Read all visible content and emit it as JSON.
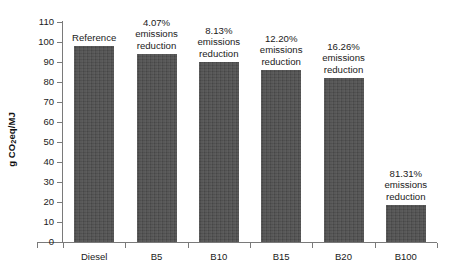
{
  "chart_data": {
    "type": "bar",
    "title": "",
    "subtitle": "",
    "xlabel": "",
    "ylabel": "g CO2eq/MJ",
    "ylabel_parts": {
      "prefix": "g CO",
      "sub": "2",
      "suffix": "eq/MJ"
    },
    "categories": [
      "Diesel",
      "B5",
      "B10",
      "B15",
      "B20",
      "B100"
    ],
    "values": [
      98.0,
      94.0,
      90.0,
      86.0,
      82.0,
      18.4
    ],
    "annotations": [
      "Reference",
      "4.07%\nemissions\nreduction",
      "8.13%\nemissions\nreduction",
      "12.20%\nemissions\nreduction",
      "16.26%\nemissions\nreduction",
      "81.31%\nemissions\nreduction"
    ],
    "annotation_lines": [
      [
        "Reference"
      ],
      [
        "4.07%",
        "emissions",
        "reduction"
      ],
      [
        "8.13%",
        "emissions",
        "reduction"
      ],
      [
        "12.20%",
        "emissions",
        "reduction"
      ],
      [
        "16.26%",
        "emissions",
        "reduction"
      ],
      [
        "81.31%",
        "emissions",
        "reduction"
      ]
    ],
    "ylim": [
      0,
      110
    ],
    "ytick_step": 10,
    "ytick_labels": [
      "110",
      "100",
      "90",
      "80",
      "70",
      "60",
      "50",
      "40",
      "30",
      "20",
      "10",
      "0"
    ],
    "grid": false,
    "legend": "none",
    "bar_color": "#4d4d4d",
    "axis_color": "#7a7a7a",
    "text_color": "#1a1a1a",
    "background": "#ffffff"
  }
}
